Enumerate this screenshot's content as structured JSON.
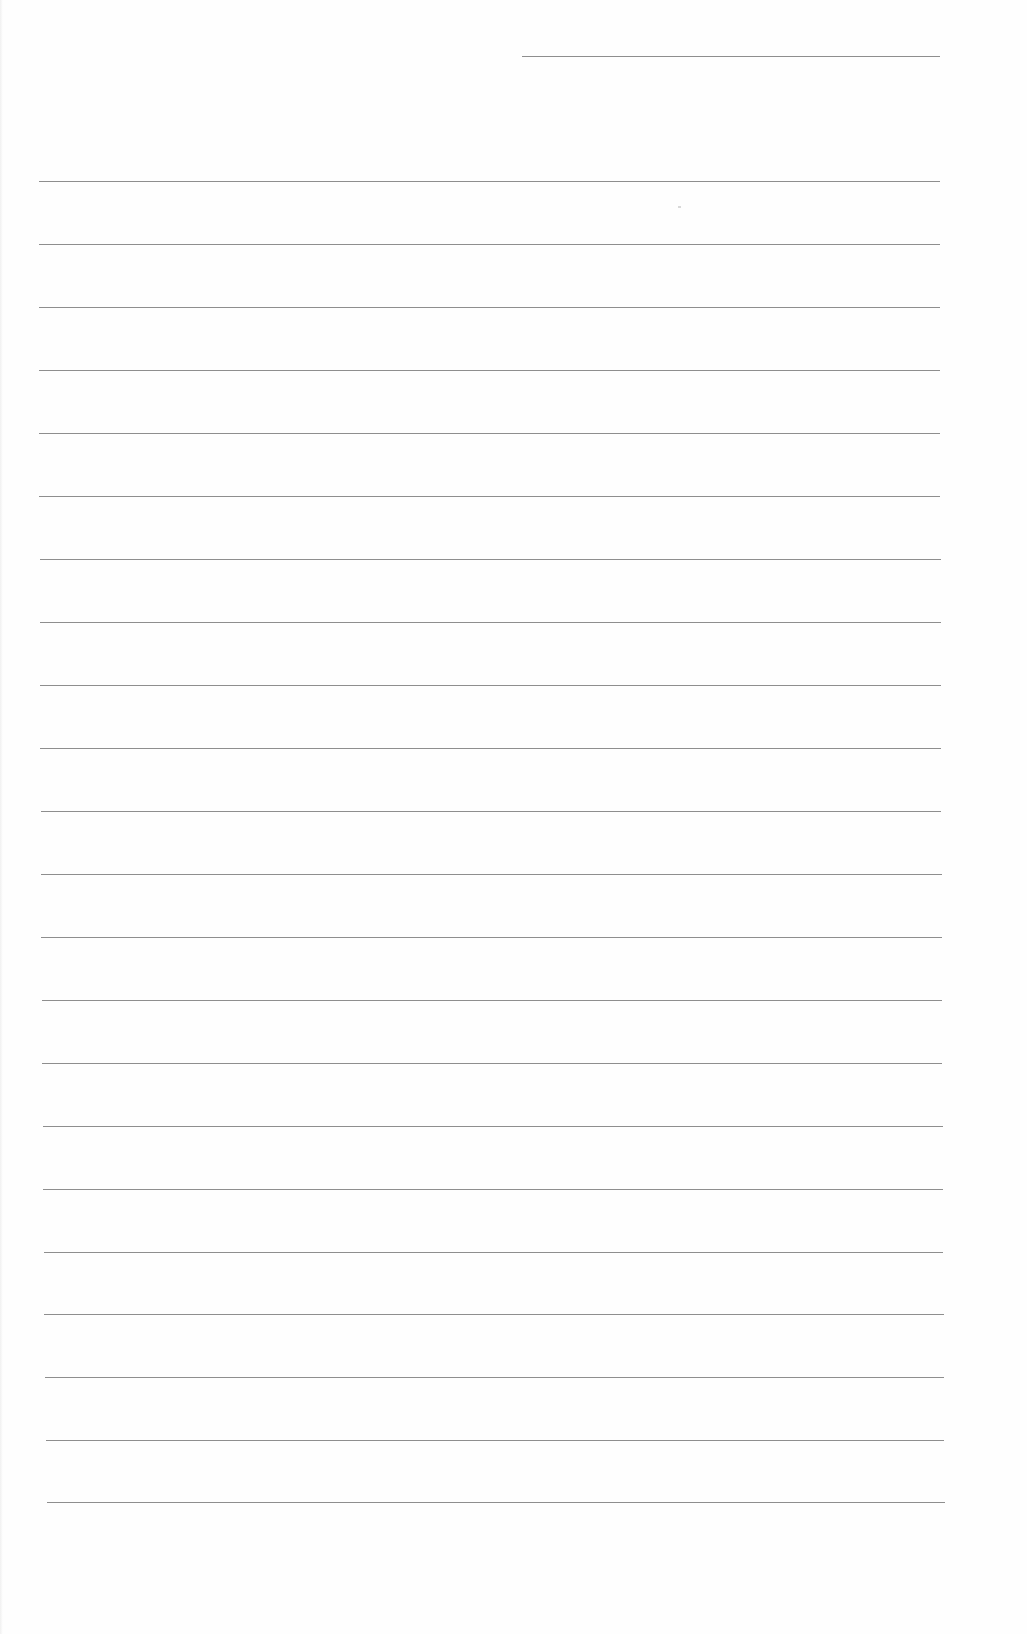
{
  "page": {
    "type": "blank-lined-writing-page",
    "background": "#fefefe",
    "rule_color": "#8e8e8e",
    "header_line": {
      "x1": 522,
      "x2": 940,
      "y": 56
    },
    "rules": [
      {
        "x1": 39,
        "x2": 940,
        "y": 181
      },
      {
        "x1": 39,
        "x2": 940,
        "y": 244
      },
      {
        "x1": 39,
        "x2": 940,
        "y": 307
      },
      {
        "x1": 39,
        "x2": 940,
        "y": 370
      },
      {
        "x1": 39,
        "x2": 940,
        "y": 433
      },
      {
        "x1": 39,
        "x2": 940,
        "y": 496
      },
      {
        "x1": 40,
        "x2": 941,
        "y": 559
      },
      {
        "x1": 40,
        "x2": 941,
        "y": 622
      },
      {
        "x1": 40,
        "x2": 941,
        "y": 685
      },
      {
        "x1": 40,
        "x2": 941,
        "y": 748
      },
      {
        "x1": 41,
        "x2": 941,
        "y": 811
      },
      {
        "x1": 41,
        "x2": 942,
        "y": 874
      },
      {
        "x1": 41,
        "x2": 942,
        "y": 937
      },
      {
        "x1": 42,
        "x2": 942,
        "y": 1000
      },
      {
        "x1": 42,
        "x2": 942,
        "y": 1063
      },
      {
        "x1": 43,
        "x2": 943,
        "y": 1126
      },
      {
        "x1": 43,
        "x2": 943,
        "y": 1189
      },
      {
        "x1": 44,
        "x2": 943,
        "y": 1252
      },
      {
        "x1": 44,
        "x2": 944,
        "y": 1314
      },
      {
        "x1": 45,
        "x2": 944,
        "y": 1377
      },
      {
        "x1": 46,
        "x2": 944,
        "y": 1440
      },
      {
        "x1": 47,
        "x2": 945,
        "y": 1502
      }
    ],
    "text_content": []
  }
}
